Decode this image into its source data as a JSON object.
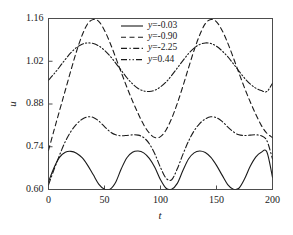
{
  "chart_data": {
    "type": "line",
    "title": "",
    "xlabel": "t",
    "ylabel": "u",
    "xlim": [
      0,
      200
    ],
    "ylim": [
      0.6,
      1.16
    ],
    "grid": false,
    "legend_position": "top-right",
    "xticks": [
      "0",
      "50",
      "100",
      "150",
      "200"
    ],
    "xtick_values": [
      0,
      50,
      100,
      150,
      200
    ],
    "yticks": [
      "0.60",
      "0.74",
      "0.88",
      "1.02",
      "1.16"
    ],
    "ytick_values": [
      0.6,
      0.74,
      0.88,
      1.02,
      1.16
    ],
    "series": [
      {
        "name": "y=-0.03",
        "label_var": "y",
        "label_value": "=-0.03",
        "linestyle": "solid",
        "dasharray": "none",
        "color": "#1a1a1a",
        "x": [
          0,
          5,
          10,
          15,
          20,
          25,
          30,
          35,
          40,
          45,
          50,
          55,
          60,
          65,
          70,
          75,
          80,
          85,
          90,
          95,
          100,
          105,
          110,
          115,
          120,
          125,
          130,
          135,
          140,
          145,
          150,
          155,
          160,
          165,
          170,
          175,
          180,
          185,
          190,
          195,
          200
        ],
        "y": [
          0.625,
          0.672,
          0.706,
          0.722,
          0.725,
          0.719,
          0.704,
          0.679,
          0.648,
          0.617,
          0.601,
          0.601,
          0.624,
          0.668,
          0.704,
          0.722,
          0.726,
          0.72,
          0.702,
          0.672,
          0.632,
          0.604,
          0.601,
          0.62,
          0.662,
          0.7,
          0.72,
          0.726,
          0.721,
          0.705,
          0.679,
          0.647,
          0.616,
          0.601,
          0.604,
          0.634,
          0.675,
          0.706,
          0.722,
          0.723,
          0.64
        ]
      },
      {
        "name": "y=-0.90",
        "label_var": "y",
        "label_value": "=-0.90",
        "linestyle": "dashed",
        "dasharray": "5,3.5",
        "color": "#1a1a1a",
        "x": [
          0,
          5,
          10,
          15,
          20,
          25,
          30,
          35,
          40,
          45,
          50,
          55,
          60,
          65,
          70,
          75,
          80,
          85,
          90,
          95,
          100,
          105,
          110,
          115,
          120,
          125,
          130,
          135,
          140,
          145,
          150,
          155,
          160,
          165,
          170,
          175,
          180,
          185,
          190,
          195,
          200
        ],
        "y": [
          0.728,
          0.795,
          0.86,
          0.925,
          0.99,
          1.052,
          1.105,
          1.143,
          1.157,
          1.15,
          1.121,
          1.08,
          1.032,
          0.983,
          0.935,
          0.89,
          0.849,
          0.812,
          0.785,
          0.77,
          0.773,
          0.795,
          0.833,
          0.882,
          0.938,
          0.998,
          1.056,
          1.106,
          1.143,
          1.157,
          1.149,
          1.121,
          1.08,
          1.032,
          0.982,
          0.933,
          0.888,
          0.847,
          0.81,
          0.784,
          0.77
        ]
      },
      {
        "name": "y=-2.25",
        "label_var": "y",
        "label_value": "=-2.25",
        "linestyle": "dash-dot",
        "dasharray": "6,2.5,1.2,2.5",
        "color": "#1a1a1a",
        "x": [
          0,
          5,
          10,
          15,
          20,
          25,
          30,
          35,
          40,
          45,
          50,
          55,
          60,
          65,
          70,
          75,
          80,
          85,
          90,
          95,
          100,
          105,
          110,
          115,
          120,
          125,
          130,
          135,
          140,
          145,
          150,
          155,
          160,
          165,
          170,
          175,
          180,
          185,
          190,
          195,
          200
        ],
        "y": [
          0.615,
          0.666,
          0.714,
          0.757,
          0.79,
          0.814,
          0.83,
          0.838,
          0.836,
          0.824,
          0.806,
          0.789,
          0.779,
          0.776,
          0.777,
          0.779,
          0.778,
          0.77,
          0.75,
          0.716,
          0.672,
          0.637,
          0.632,
          0.668,
          0.715,
          0.758,
          0.792,
          0.816,
          0.831,
          0.838,
          0.835,
          0.823,
          0.805,
          0.789,
          0.779,
          0.777,
          0.778,
          0.779,
          0.776,
          0.76,
          0.7
        ]
      },
      {
        "name": "y=0.44",
        "label_var": "y",
        "label_value": "=0.44",
        "linestyle": "dash-dot-dot",
        "dasharray": "6,2.2,1.2,2.2,1.2,2.2",
        "color": "#1a1a1a",
        "x": [
          0,
          5,
          10,
          15,
          20,
          25,
          30,
          35,
          40,
          45,
          50,
          55,
          60,
          65,
          70,
          75,
          80,
          85,
          90,
          95,
          100,
          105,
          110,
          115,
          120,
          125,
          130,
          135,
          140,
          145,
          150,
          155,
          160,
          165,
          170,
          175,
          180,
          185,
          190,
          195,
          200
        ],
        "y": [
          0.958,
          0.979,
          1.002,
          1.026,
          1.048,
          1.065,
          1.076,
          1.08,
          1.078,
          1.07,
          1.056,
          1.037,
          1.014,
          0.99,
          0.966,
          0.946,
          0.931,
          0.923,
          0.921,
          0.925,
          0.936,
          0.952,
          0.974,
          0.998,
          1.022,
          1.045,
          1.063,
          1.075,
          1.08,
          1.078,
          1.069,
          1.054,
          1.035,
          1.012,
          0.988,
          0.965,
          0.946,
          0.932,
          0.924,
          0.921,
          0.948
        ]
      }
    ]
  }
}
